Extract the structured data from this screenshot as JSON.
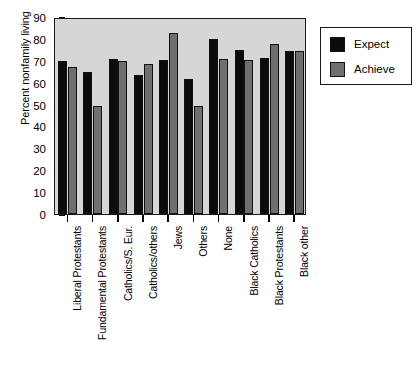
{
  "chart_data": {
    "type": "bar",
    "title": "",
    "xlabel": "",
    "ylabel": "Percent nonfamily living",
    "ylim": [
      0,
      90
    ],
    "yticks": [
      0,
      10,
      20,
      30,
      40,
      50,
      60,
      70,
      80,
      90
    ],
    "grid": false,
    "legend_position": "right",
    "categories": [
      "Liberal Protestants",
      "Fundamental Protestants",
      "Catholics/S. Eur.",
      "Catholics/others",
      "Jews",
      "Others",
      "None",
      "Black Catholics",
      "Black Protestants",
      "Black other"
    ],
    "series": [
      {
        "name": "Expect",
        "color": "#0b0b0b",
        "values": [
          70,
          65,
          71,
          63.5,
          70.5,
          61.5,
          80,
          75,
          71.5,
          74.5
        ]
      },
      {
        "name": "Achieve",
        "color": "#6f6f6f",
        "values": [
          67,
          49.5,
          70,
          68.5,
          82.5,
          49.5,
          71,
          70.5,
          77.5,
          74.5
        ]
      }
    ]
  },
  "legend": {
    "entries": [
      {
        "label": "Expect",
        "swatch": "expect"
      },
      {
        "label": "Achieve",
        "swatch": "achieve"
      }
    ]
  },
  "caption": {
    "text": ""
  },
  "colors": {
    "plot_background": "#d6d6d4",
    "expect": "#0b0b0b",
    "achieve": "#6f6f6f",
    "axis": "#1a1a1a"
  }
}
